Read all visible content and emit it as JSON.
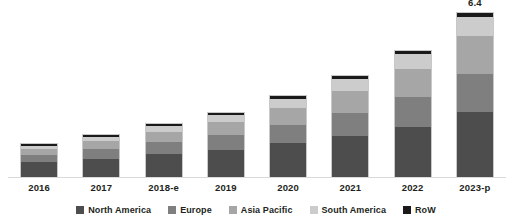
{
  "chart_data": {
    "type": "bar",
    "stacked": true,
    "title": "",
    "subtitle": "",
    "xlabel": "",
    "ylabel": "",
    "grid": false,
    "axis_visible": false,
    "ylim": [
      0,
      7.0
    ],
    "legend_position": "bottom",
    "categories": [
      "2016",
      "2017",
      "2018-e",
      "2019",
      "2020",
      "2021",
      "2022",
      "2023-p"
    ],
    "series": [
      {
        "name": "North America",
        "color": "#4d4d4d",
        "values": [
          0.62,
          0.78,
          0.95,
          1.15,
          1.42,
          1.72,
          2.1,
          2.72
        ]
      },
      {
        "name": "Europe",
        "color": "#7f7f7f",
        "values": [
          0.33,
          0.42,
          0.52,
          0.62,
          0.78,
          0.96,
          1.22,
          1.58
        ]
      },
      {
        "name": "Asia Pacific",
        "color": "#a6a6a6",
        "values": [
          0.25,
          0.33,
          0.43,
          0.55,
          0.7,
          0.92,
          1.2,
          1.58
        ]
      },
      {
        "name": "South America",
        "color": "#cccccc",
        "values": [
          0.14,
          0.18,
          0.24,
          0.3,
          0.38,
          0.48,
          0.6,
          0.78
        ]
      },
      {
        "name": "RoW",
        "color": "#1a1a1a",
        "values": [
          0.06,
          0.07,
          0.08,
          0.09,
          0.11,
          0.13,
          0.15,
          0.18
        ]
      }
    ],
    "totals": [
      1.4,
      1.78,
      2.22,
      2.71,
      3.39,
      4.21,
      5.27,
      6.84
    ],
    "data_labels": [
      {
        "category": "2023-p",
        "text": "6.4"
      }
    ]
  },
  "legend": {
    "items": [
      {
        "label": "North America",
        "color": "#4d4d4d"
      },
      {
        "label": "Europe",
        "color": "#7f7f7f"
      },
      {
        "label": "Asia Pacific",
        "color": "#a6a6a6"
      },
      {
        "label": "South America",
        "color": "#cccccc"
      },
      {
        "label": "RoW",
        "color": "#1a1a1a"
      }
    ]
  }
}
